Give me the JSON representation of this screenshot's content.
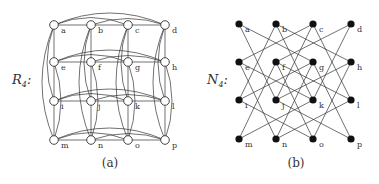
{
  "panels": [
    {
      "id": "a",
      "graph_name": "R",
      "graph_sub": "4",
      "caption": "(a)",
      "node_style": "hollow",
      "cols_x": [
        54,
        91,
        128,
        165
      ],
      "rows_y": [
        25,
        62,
        101,
        140
      ],
      "nodes": [
        "a",
        "b",
        "c",
        "d",
        "e",
        "f",
        "g",
        "h",
        "i",
        "j",
        "k",
        "l",
        "m",
        "n",
        "o",
        "p"
      ],
      "edge_rule": "rook (same row or same column)"
    },
    {
      "id": "b",
      "graph_name": "N",
      "graph_sub": "4",
      "caption": "(b)",
      "node_style": "filled",
      "cols_x": [
        239,
        276,
        313,
        351
      ],
      "rows_y": [
        24,
        62,
        100,
        139
      ],
      "nodes": [
        "a",
        "b",
        "c",
        "d",
        "e",
        "f",
        "g",
        "h",
        "i",
        "j",
        "k",
        "l",
        "m",
        "n",
        "o",
        "p"
      ],
      "edge_rule": "knight move"
    }
  ],
  "colors": {
    "stroke": "#333333",
    "node_fill_hollow": "#ffffff",
    "node_fill_filled": "#111111"
  }
}
